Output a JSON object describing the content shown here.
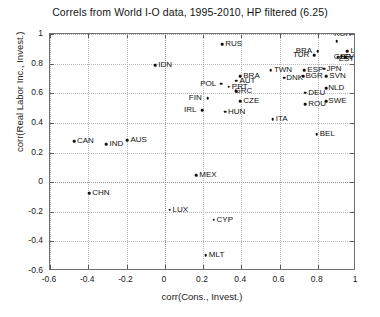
{
  "chart_data": {
    "type": "scatter",
    "title": "Correls from World I-O data, 1995-2010, HP filtered (6.25)",
    "xlabel": "corr(Cons., Invest.)",
    "ylabel": "corr(Real Labor Inc., Invest.)",
    "xlim": [
      -0.6,
      1.0
    ],
    "ylim": [
      -0.6,
      1.0
    ],
    "xticks": [
      "-0.6",
      "-0.4",
      "-0.2",
      "0",
      "0.2",
      "0.4",
      "0.6",
      "0.8",
      "1"
    ],
    "xtickvals": [
      -0.6,
      -0.4,
      -0.2,
      0,
      0.2,
      0.4,
      0.6,
      0.8,
      1.0
    ],
    "yticks": [
      "-0.6",
      "-0.4",
      "-0.2",
      "0",
      "0.2",
      "0.4",
      "0.6",
      "0.8",
      "1"
    ],
    "ytickvals": [
      -0.6,
      -0.4,
      -0.2,
      0,
      0.2,
      0.4,
      0.6,
      0.8,
      1.0
    ],
    "grid": "dotted gridlines at each tick, emphasised at x=0 and y=0",
    "legend": "none",
    "points": [
      {
        "label": "RUS",
        "x": 0.3,
        "y": 0.93,
        "lab_dx": 3,
        "lab_dy": 0
      },
      {
        "label": "IDN",
        "x": -0.05,
        "y": 0.79,
        "lab_dx": 3,
        "lab_dy": 0
      },
      {
        "label": "KOR",
        "x": 0.9,
        "y": 0.95,
        "lab_dx": -3,
        "lab_dy": -7
      },
      {
        "label": "BRA",
        "x": 0.8,
        "y": 0.885,
        "lab_dx": -22,
        "lab_dy": 0
      },
      {
        "label": "TUR",
        "x": 0.78,
        "y": 0.855,
        "lab_dx": -21,
        "lab_dy": 0
      },
      {
        "label": "LVA",
        "x": 0.955,
        "y": 0.885,
        "lab_dx": 3,
        "lab_dy": 0
      },
      {
        "label": "SVK",
        "x": 0.945,
        "y": 0.845,
        "lab_dx": -2,
        "lab_dy": 0
      },
      {
        "label": "EST",
        "x": 0.925,
        "y": 0.852,
        "lab_dx": -3,
        "lab_dy": 3
      },
      {
        "label": "GBR",
        "x": 0.905,
        "y": 0.845,
        "lab_dx": -4,
        "lab_dy": 0
      },
      {
        "label": "TWN",
        "x": 0.555,
        "y": 0.755,
        "lab_dx": 3,
        "lab_dy": 0
      },
      {
        "label": "ESP",
        "x": 0.73,
        "y": 0.755,
        "lab_dx": 3,
        "lab_dy": 0
      },
      {
        "label": "JPN",
        "x": 0.835,
        "y": 0.765,
        "lab_dx": 2,
        "lab_dy": 0
      },
      {
        "label": "BGR",
        "x": 0.725,
        "y": 0.715,
        "lab_dx": 2,
        "lab_dy": 0
      },
      {
        "label": "SVN",
        "x": 0.845,
        "y": 0.715,
        "lab_dx": 3,
        "lab_dy": 0
      },
      {
        "label": "DNK",
        "x": 0.625,
        "y": 0.705,
        "lab_dx": 2,
        "lab_dy": 0
      },
      {
        "label": "BRA2",
        "x": 0.395,
        "y": 0.715,
        "lab_dx": 3,
        "lab_dy": 0
      },
      {
        "label": "AUT",
        "x": 0.375,
        "y": 0.685,
        "lab_dx": 3,
        "lab_dy": 0
      },
      {
        "label": "POL",
        "x": 0.295,
        "y": 0.665,
        "lab_dx": -21,
        "lab_dy": 0
      },
      {
        "label": "PRT",
        "x": 0.335,
        "y": 0.645,
        "lab_dx": 3,
        "lab_dy": 0
      },
      {
        "label": "GRC",
        "x": 0.375,
        "y": 0.615,
        "lab_dx": -2,
        "lab_dy": 0
      },
      {
        "label": "DEU",
        "x": 0.735,
        "y": 0.605,
        "lab_dx": 3,
        "lab_dy": 0
      },
      {
        "label": "NLD",
        "x": 0.845,
        "y": 0.635,
        "lab_dx": 2,
        "lab_dy": 0
      },
      {
        "label": "FIN",
        "x": 0.225,
        "y": 0.565,
        "lab_dx": -19,
        "lab_dy": 0
      },
      {
        "label": "CZE",
        "x": 0.395,
        "y": 0.545,
        "lab_dx": 3,
        "lab_dy": 0
      },
      {
        "label": "ROU",
        "x": 0.735,
        "y": 0.525,
        "lab_dx": 3,
        "lab_dy": 0
      },
      {
        "label": "SWE",
        "x": 0.845,
        "y": 0.545,
        "lab_dx": 2,
        "lab_dy": 0
      },
      {
        "label": "IRL",
        "x": 0.195,
        "y": 0.485,
        "lab_dx": -18,
        "lab_dy": 0
      },
      {
        "label": "HUN",
        "x": 0.315,
        "y": 0.475,
        "lab_dx": 3,
        "lab_dy": 0
      },
      {
        "label": "ITA",
        "x": 0.565,
        "y": 0.425,
        "lab_dx": 3,
        "lab_dy": 0
      },
      {
        "label": "BEL",
        "x": 0.795,
        "y": 0.325,
        "lab_dx": 3,
        "lab_dy": 0
      },
      {
        "label": "CAN",
        "x": -0.475,
        "y": 0.275,
        "lab_dx": 3,
        "lab_dy": 0
      },
      {
        "label": "IND",
        "x": -0.305,
        "y": 0.255,
        "lab_dx": 3,
        "lab_dy": 0
      },
      {
        "label": "AUS",
        "x": -0.195,
        "y": 0.285,
        "lab_dx": 3,
        "lab_dy": 0
      },
      {
        "label": "MEX",
        "x": 0.165,
        "y": 0.045,
        "lab_dx": 3,
        "lab_dy": 0
      },
      {
        "label": "CHN",
        "x": -0.395,
        "y": -0.075,
        "lab_dx": 3,
        "lab_dy": 0
      },
      {
        "label": "LUX",
        "x": 0.025,
        "y": -0.185,
        "lab_dx": 3,
        "lab_dy": 0
      },
      {
        "label": "CYP",
        "x": 0.255,
        "y": -0.255,
        "lab_dx": 3,
        "lab_dy": 0
      },
      {
        "label": "MLT",
        "x": 0.215,
        "y": -0.495,
        "lab_dx": 3,
        "lab_dy": 0
      }
    ]
  }
}
